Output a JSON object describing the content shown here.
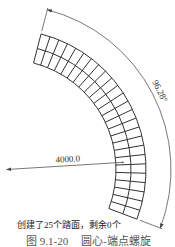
{
  "figure": {
    "status_message": "创建了25个踏面，剩余0个",
    "caption_number": "图 9.1-20",
    "caption_title": "圆心-端点螺旋"
  },
  "dimensions": {
    "angle_label": "96.28°",
    "radius_label": "4000.0"
  },
  "drawing": {
    "tread_count": 25,
    "treads_remaining": 0,
    "sweep_angle_deg": 96.28,
    "radius_value": 4000.0,
    "bands": 2,
    "line_color": "#333333",
    "dimension_color": "#555555",
    "caption_color": "#555555"
  }
}
